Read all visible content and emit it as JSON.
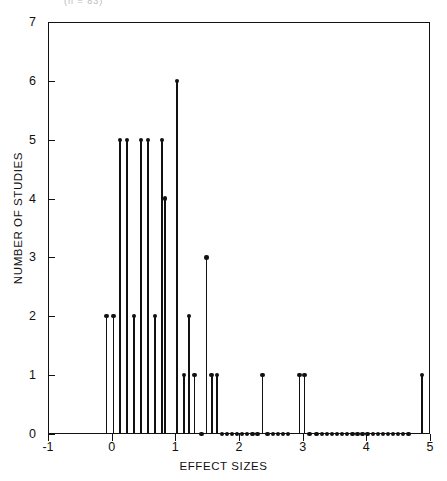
{
  "header": {
    "fragment": "(n = 83)"
  },
  "chart_data": {
    "type": "scatter",
    "title": "",
    "xlabel": "EFFECT SIZES",
    "ylabel": "NUMBER OF STUDIES",
    "xlim": [
      -1,
      5
    ],
    "ylim": [
      0,
      7
    ],
    "xticks": [
      "-1",
      "0",
      "1",
      "2",
      "3",
      "4",
      "5"
    ],
    "xtick_values": [
      -1,
      0,
      1,
      2,
      3,
      4,
      5
    ],
    "yticks": [
      "0",
      "1",
      "2",
      "3",
      "4",
      "5",
      "6",
      "7"
    ],
    "ytick_values": [
      0,
      1,
      2,
      3,
      4,
      5,
      6,
      7
    ],
    "grid": false,
    "legend": null,
    "marker": "filled-circle",
    "stem_color": "#111111",
    "x": [
      -0.08,
      0.03,
      0.13,
      0.24,
      0.35,
      0.46,
      0.57,
      0.68,
      0.79,
      0.84,
      1.03,
      1.14,
      1.21,
      1.3,
      1.41,
      1.49,
      1.57,
      1.65,
      1.73,
      1.81,
      1.89,
      1.97,
      2.05,
      2.13,
      2.21,
      2.29,
      2.37,
      2.45,
      2.53,
      2.61,
      2.69,
      2.77,
      2.95,
      3.03,
      3.11,
      3.22,
      3.3,
      3.38,
      3.46,
      3.54,
      3.62,
      3.7,
      3.78,
      3.86,
      3.94,
      4.02,
      4.1,
      4.18,
      4.26,
      4.34,
      4.42,
      4.5,
      4.58,
      4.66,
      4.87
    ],
    "y": [
      2,
      2,
      5,
      5,
      2,
      5,
      5,
      2,
      5,
      4,
      6,
      1,
      2,
      1,
      0,
      3,
      1,
      1,
      0,
      0,
      0,
      0,
      0,
      0,
      0,
      0,
      1,
      0,
      0,
      0,
      0,
      0,
      1,
      1,
      0,
      0,
      0,
      0,
      0,
      0,
      0,
      0,
      0,
      0,
      0,
      0,
      0,
      0,
      0,
      0,
      0,
      0,
      0,
      0,
      1
    ],
    "values_note": "Each point: number of studies reporting the given effect size"
  }
}
